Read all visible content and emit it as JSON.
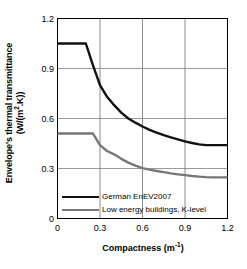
{
  "chart_data": {
    "type": "line",
    "title": "",
    "xlabel": "Compactness (m-1)",
    "xlabel_base": "Compactness (m",
    "xlabel_sup": "-1",
    "xlabel_tail": ")",
    "ylabel_line1": "Envelope's thermal transmittance",
    "ylabel_line2": "(W/(m2.K))",
    "ylabel_line2_base": "(W/(m",
    "ylabel_line2_sup": "2",
    "ylabel_line2_tail": ".K))",
    "xlim": [
      0,
      1.2
    ],
    "ylim": [
      0,
      1.2
    ],
    "xticks": [
      "0",
      "0.3",
      "0.6",
      "0.9",
      "1.2"
    ],
    "xtick_values": [
      0,
      0.3,
      0.6,
      0.9,
      1.2
    ],
    "yticks": [
      "0",
      "0.3",
      "0.6",
      "0.9",
      "1.2"
    ],
    "ytick_values": [
      0,
      0.3,
      0.6,
      0.9,
      1.2
    ],
    "grid": "both",
    "grid_color": "#808080",
    "legend_position": "bottom-left-inside",
    "series": [
      {
        "name": "German EnEV2007",
        "color": "#111111",
        "width": 2.4,
        "x": [
          0,
          0.05,
          0.1,
          0.15,
          0.2,
          0.25,
          0.3,
          0.35,
          0.4,
          0.45,
          0.5,
          0.55,
          0.6,
          0.65,
          0.7,
          0.75,
          0.8,
          0.85,
          0.9,
          0.95,
          1.0,
          1.05,
          1.1,
          1.15,
          1.2
        ],
        "values": [
          1.05,
          1.05,
          1.05,
          1.05,
          1.05,
          0.92,
          0.8,
          0.73,
          0.68,
          0.635,
          0.6,
          0.575,
          0.552,
          0.532,
          0.515,
          0.5,
          0.487,
          0.475,
          0.463,
          0.453,
          0.445,
          0.44,
          0.44,
          0.44,
          0.44
        ]
      },
      {
        "name": "Low  energy buildings, K-level",
        "color": "#777777",
        "width": 2.4,
        "x": [
          0,
          0.05,
          0.1,
          0.15,
          0.2,
          0.25,
          0.3,
          0.35,
          0.4,
          0.45,
          0.5,
          0.55,
          0.6,
          0.65,
          0.7,
          0.75,
          0.8,
          0.85,
          0.9,
          0.95,
          1.0,
          1.05,
          1.1,
          1.15,
          1.2
        ],
        "values": [
          0.51,
          0.51,
          0.51,
          0.51,
          0.51,
          0.51,
          0.44,
          0.405,
          0.385,
          0.358,
          0.335,
          0.317,
          0.302,
          0.293,
          0.285,
          0.278,
          0.271,
          0.265,
          0.26,
          0.255,
          0.251,
          0.248,
          0.247,
          0.247,
          0.247
        ]
      }
    ]
  },
  "legend": {
    "items": [
      {
        "label": "German EnEV2007",
        "swatch": "black-line-swatch"
      },
      {
        "label": "Low  energy buildings, K-level",
        "swatch": "gray-line-swatch"
      }
    ]
  }
}
